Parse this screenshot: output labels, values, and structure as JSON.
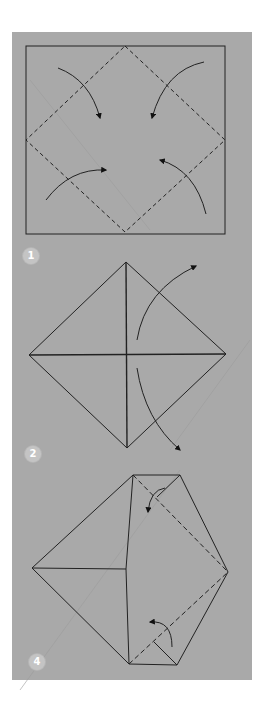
{
  "diagram": {
    "type": "origami-instructions",
    "colors": {
      "panel": "#a9a9a9",
      "stroke": "#222222",
      "badge": "#c4c4c4",
      "badge_text": "#ffffff",
      "guide": "#9a9a9a"
    },
    "steps": [
      {
        "number": "1",
        "description": "Square with dashed diamond; four corners fold to center"
      },
      {
        "number": "2",
        "description": "Diamond with center cross; right flaps unfold outward"
      },
      {
        "number": "4",
        "description": "Diamond with right-side flaps folded along dashed lines"
      }
    ]
  }
}
